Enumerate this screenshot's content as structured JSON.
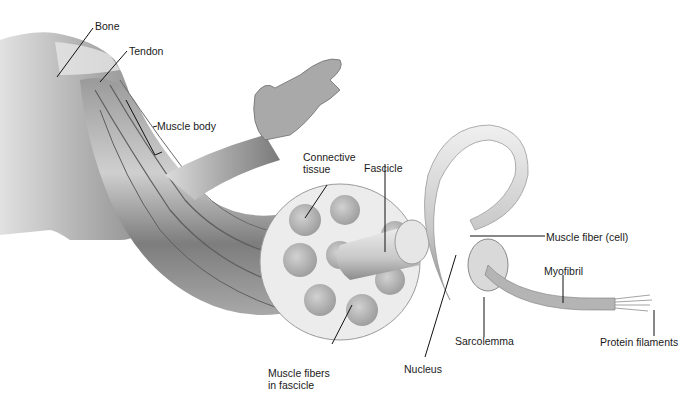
{
  "diagram": {
    "labels": {
      "bone": "Bone",
      "tendon": "Tendon",
      "muscle_body": "Muscle body",
      "connective_tissue_1": "Connective",
      "connective_tissue_2": "tissue",
      "fascicle": "Fascicle",
      "muscle_fiber_cell": "Muscle fiber (cell)",
      "myofibril": "Myofibril",
      "protein_filaments": "Protein filaments",
      "sarcolemma": "Sarcolemma",
      "nucleus": "Nucleus",
      "muscle_fibers_in_fascicle_1": "Muscle fibers",
      "muscle_fibers_in_fascicle_2": "in fascicle"
    },
    "colors": {
      "background": "#ffffff",
      "text": "#1a1a1a",
      "leader_line": "#111111",
      "tissue_light": "#ececec",
      "tissue_mid": "#bdbdbd",
      "tissue_dark": "#6e6e6e"
    }
  }
}
